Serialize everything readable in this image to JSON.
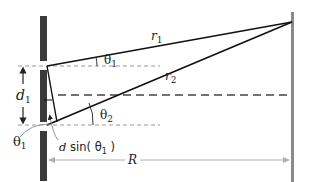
{
  "diagram": {
    "labels": {
      "r1": "r",
      "r1_sub": "1",
      "r2": "r",
      "r2_sub": "2",
      "theta1": "θ",
      "theta1_sub": "1",
      "theta2": "θ",
      "theta2_sub": "2",
      "d1": "d",
      "d1_sub": "1",
      "theta1_left": "θ",
      "theta1_left_sub": "1",
      "path_diff_d": "d",
      "path_diff_sin": " sin( θ",
      "path_diff_sub": "1",
      "path_diff_close": " )",
      "R": "R"
    },
    "colors": {
      "barrier": "#3a3a3a",
      "screen": "#8a8a8a",
      "ray": "#111111",
      "dashed": "#9a9a9a",
      "center_dashed": "#444444",
      "arrow_R": "#b0b0b0"
    }
  }
}
